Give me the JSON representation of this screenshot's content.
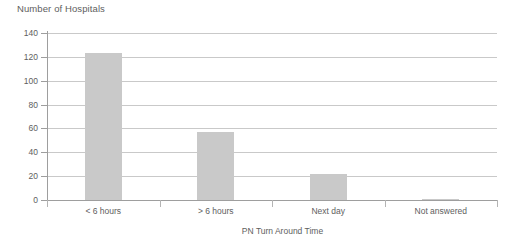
{
  "chart_data": {
    "type": "bar",
    "title": "Number of Hospitals",
    "xlabel": "PN Turn Around Time",
    "ylabel": "",
    "categories": [
      "< 6 hours",
      "> 6 hours",
      "Next day",
      "Not answered"
    ],
    "values": [
      123,
      57,
      22,
      1
    ],
    "ylim": [
      0,
      140
    ],
    "yticks": [
      0,
      20,
      40,
      60,
      80,
      100,
      120,
      140
    ],
    "ytick_labels": [
      "0",
      "20",
      "40",
      "60",
      "80",
      "100",
      "120",
      "140"
    ],
    "grid": "horizontal",
    "legend": "none",
    "series": [
      {
        "name": "Number of Hospitals",
        "values": [
          123,
          57,
          22,
          1
        ]
      }
    ],
    "colors": {
      "bar": "#c9c9c9",
      "gridline": "#c9c9c9",
      "axis": "#9e9e9e",
      "text": "#5e5e5e",
      "background": "#ffffff"
    }
  }
}
